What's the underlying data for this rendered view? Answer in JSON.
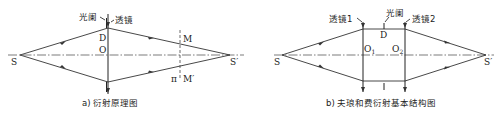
{
  "diagram_a": {
    "caption": "a) 衍射原理图",
    "labels": {
      "source": "S",
      "image": "S′",
      "aperture": "光阑",
      "lens": "透镜",
      "D": "D",
      "O": "O",
      "M": "M",
      "M_prime": "M′",
      "pi": "π"
    }
  },
  "diagram_b": {
    "caption": "b) 夫琅和费衍射基本结构图",
    "labels": {
      "source": "S",
      "image": "S′",
      "lens1": "透镜1",
      "lens2": "透镜2",
      "aperture": "光阑",
      "D": "D",
      "O1": "O",
      "O1_sub": "1",
      "O2": "O",
      "O2_sub": "2"
    }
  }
}
